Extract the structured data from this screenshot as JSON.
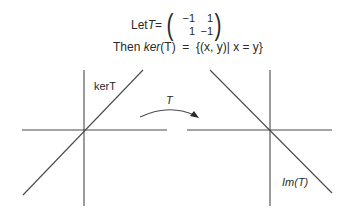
{
  "header": {
    "let_prefix": "Let ",
    "T_symbol": "T",
    "equals": " =",
    "matrix": [
      [
        "−1",
        "1"
      ],
      [
        "1",
        "−1"
      ]
    ],
    "then_prefix": "Then ",
    "ker": "ker",
    "ker_arg": "(T)",
    "set_expr": "  =  {(x, y)| x = y}"
  },
  "diagram": {
    "left_label": "kerT",
    "arrow_label": "T",
    "right_label": "Im(T)"
  }
}
